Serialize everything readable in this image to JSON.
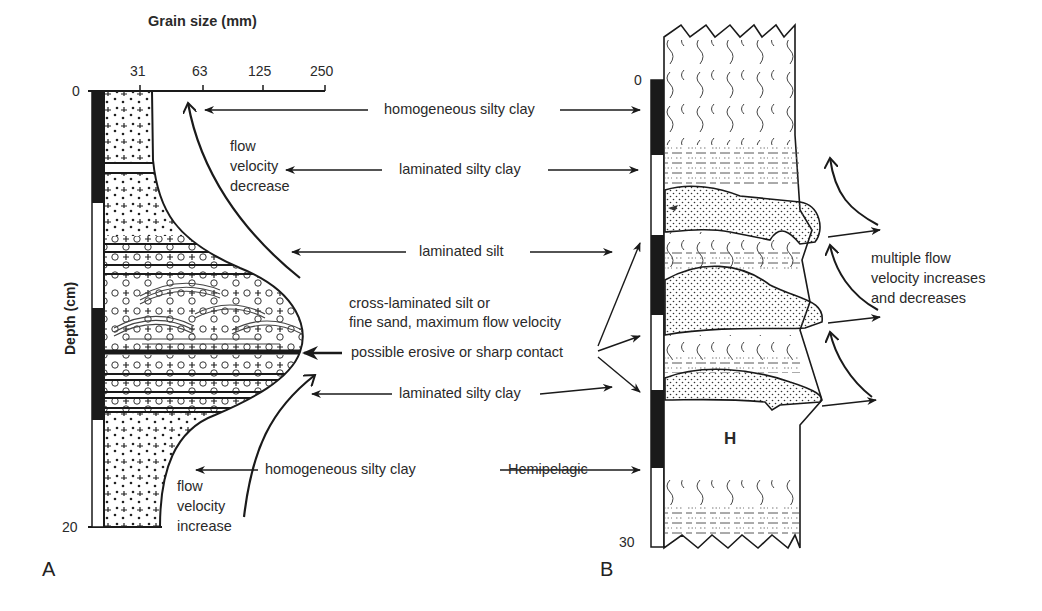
{
  "panel_a": {
    "label": "A",
    "x_axis_title": "Grain size (mm)",
    "x_ticks": [
      "31",
      "63",
      "125",
      "250"
    ],
    "y_axis_title": "Depth (cm)",
    "y_ticks": [
      "0",
      "20"
    ],
    "annotations": {
      "flow_decrease": [
        "flow",
        "velocity",
        "decrease"
      ],
      "flow_increase": [
        "flow",
        "velocity",
        "increase"
      ]
    }
  },
  "panel_b": {
    "label": "B",
    "y_ticks": [
      "0",
      "30"
    ],
    "hemipelagic_marker": "H",
    "multiple_flow": [
      "multiple flow",
      "velocity increases",
      "and decreases"
    ]
  },
  "center_labels": {
    "homogeneous_top": "homogeneous silty clay",
    "laminated_silty_clay_top": "laminated silty clay",
    "laminated_silt": "laminated silt",
    "cross_laminated": [
      "cross-laminated silt or",
      "fine sand, maximum flow velocity"
    ],
    "erosive_contact": "possible erosive or sharp contact",
    "laminated_silty_clay_bottom": "laminated silty clay",
    "homogeneous_bottom": "homogeneous silty clay",
    "hemipelagic": "Hemipelagic"
  },
  "colors": {
    "ink": "#1a1a1a",
    "background": "#ffffff"
  }
}
